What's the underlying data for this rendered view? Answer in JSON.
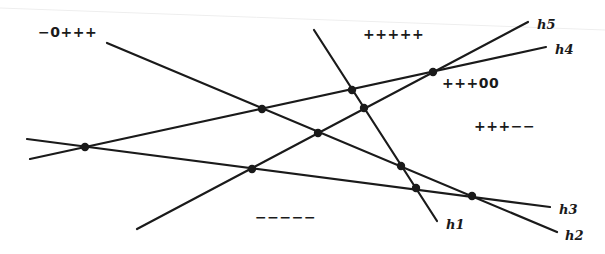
{
  "diagram": {
    "type": "line-arrangement",
    "colors": {
      "ink": "#1a1a1a",
      "background": "#ffffff"
    },
    "lines": [
      {
        "id": "h1",
        "label": "h1",
        "x1": 314,
        "y1": 30,
        "x2": 437,
        "y2": 221,
        "lx": 446,
        "ly": 229
      },
      {
        "id": "h2",
        "label": "h2",
        "x1": 107,
        "y1": 43,
        "x2": 557,
        "y2": 232,
        "lx": 565,
        "ly": 240
      },
      {
        "id": "h3",
        "label": "h3",
        "x1": 27,
        "y1": 139,
        "x2": 550,
        "y2": 207,
        "lx": 559,
        "ly": 214
      },
      {
        "id": "h4",
        "label": "h4",
        "x1": 30,
        "y1": 159,
        "x2": 546,
        "y2": 47,
        "lx": 555,
        "ly": 54
      },
      {
        "id": "h5",
        "label": "h5",
        "x1": 137,
        "y1": 229,
        "x2": 528,
        "y2": 22,
        "lx": 537,
        "ly": 29
      }
    ],
    "vertices": [
      {
        "x": 85,
        "y": 147
      },
      {
        "x": 262,
        "y": 109
      },
      {
        "x": 352,
        "y": 90
      },
      {
        "x": 364,
        "y": 108
      },
      {
        "x": 318,
        "y": 133
      },
      {
        "x": 252,
        "y": 169
      },
      {
        "x": 401,
        "y": 166
      },
      {
        "x": 416,
        "y": 188
      },
      {
        "x": 472,
        "y": 196
      },
      {
        "x": 433,
        "y": 72
      }
    ],
    "regions": [
      {
        "label": "−0+++",
        "x": 38,
        "y": 37
      },
      {
        "label": "+++++",
        "x": 363,
        "y": 39
      },
      {
        "label": "+++00",
        "x": 442,
        "y": 88
      },
      {
        "label": "+++−−",
        "x": 474,
        "y": 131
      },
      {
        "label": "−−−−−",
        "x": 255,
        "y": 222
      }
    ]
  }
}
